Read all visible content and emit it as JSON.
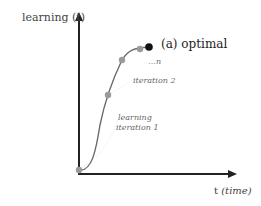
{
  "diagram": {
    "axes": {
      "y_label": "learning (t)",
      "x_label": "t",
      "x_label_italic": "(time)"
    },
    "annotations": {
      "optimal": "(a) optimal",
      "ellipsis": "…n",
      "iteration2": "iteration 2",
      "iteration1_line1": "learning",
      "iteration1_line2": "iteration 1"
    },
    "points": [
      {
        "name": "start",
        "x": 79,
        "y": 170,
        "color": "#9a9a9a"
      },
      {
        "name": "iteration-1",
        "x": 108,
        "y": 95,
        "color": "#9a9a9a"
      },
      {
        "name": "iteration-2",
        "x": 122,
        "y": 60,
        "color": "#9a9a9a"
      },
      {
        "name": "iteration-n",
        "x": 140,
        "y": 49,
        "color": "#9a9a9a"
      },
      {
        "name": "optimal",
        "x": 149,
        "y": 47,
        "color": "#111111"
      }
    ],
    "colors": {
      "axis": "#222222",
      "curve": "#6b6b6b",
      "point": "#9a9a9a",
      "optimal_point": "#111111"
    }
  }
}
